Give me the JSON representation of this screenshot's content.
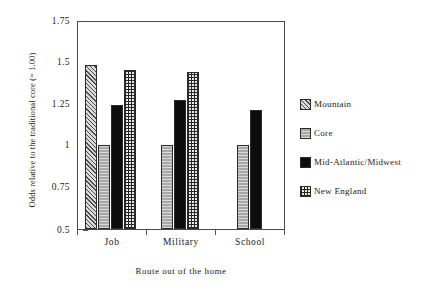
{
  "chart_data": {
    "type": "bar",
    "title": "",
    "xlabel": "Route out of the home",
    "ylabel": "Odds relative to the traditional core (= 1.00)",
    "categories": [
      "Job",
      "Military",
      "School"
    ],
    "ylim": [
      0.5,
      1.75
    ],
    "yticks": [
      0.5,
      0.75,
      1,
      1.25,
      1.5,
      1.75
    ],
    "ytick_labels": [
      "0.5",
      "0.75",
      "1",
      "1.25",
      "1.5",
      "1.75"
    ],
    "grid": false,
    "legend_position": "right",
    "series": [
      {
        "name": "Mountain",
        "pattern": "diagonal-hatch",
        "values": [
          1.48,
          null,
          null
        ]
      },
      {
        "name": "Core",
        "pattern": "solid-gray",
        "values": [
          1.0,
          1.0,
          1.0
        ]
      },
      {
        "name": "Mid-Atlantic/Midwest",
        "pattern": "solid-black",
        "values": [
          1.24,
          1.27,
          1.21
        ]
      },
      {
        "name": "New England",
        "pattern": "crosshatch-grid",
        "values": [
          1.45,
          1.44,
          null
        ]
      }
    ]
  },
  "axes": {
    "y_title": "Odds relative to the traditional core (= 1.00)",
    "x_title": "Route out of the home",
    "y_ticks": [
      {
        "label": "1.75",
        "value": 1.75
      },
      {
        "label": "1.5",
        "value": 1.5
      },
      {
        "label": "1.25",
        "value": 1.25
      },
      {
        "label": "1",
        "value": 1.0
      },
      {
        "label": "0.75",
        "value": 0.75
      },
      {
        "label": "0.5",
        "value": 0.5
      }
    ],
    "x_ticks": [
      {
        "label": "Job"
      },
      {
        "label": "Military"
      },
      {
        "label": "School"
      }
    ]
  },
  "legend": {
    "entries": [
      {
        "label": "Mountain"
      },
      {
        "label": "Core"
      },
      {
        "label": "Mid-Atlantic/Midwest"
      },
      {
        "label": "New England"
      }
    ]
  }
}
